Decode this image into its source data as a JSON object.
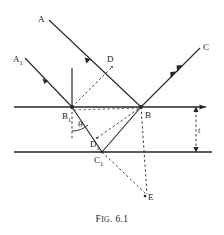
{
  "figure": {
    "caption_prefix": "F",
    "caption_smallcaps": "IG",
    "caption_rest": ". 6.1",
    "caption_full": "FIG. 6.1",
    "stroke_color": "#262626",
    "background_color": "#ffffff"
  },
  "labels": {
    "ray_a": "A",
    "ray_a1_base": "A",
    "ray_a1_sub": "1",
    "ray_c": "C",
    "point_d": "D",
    "point_d1_base": "D",
    "point_d1_sub": "1",
    "point_b_base": "B",
    "point_b1_base": "B",
    "point_b1_sub": "1",
    "point_c1_base": "C",
    "point_c1_sub": "1",
    "point_e": "E",
    "angle_theta": "θ",
    "thickness": "t"
  },
  "geometry": {
    "surface_top_y": 107,
    "surface_bottom_y": 152,
    "surface_left_x": 14,
    "surface_top_right_x": 206,
    "surface_bottom_right_x": 212,
    "point_b1": {
      "x": 72,
      "y": 107
    },
    "point_b": {
      "x": 141,
      "y": 107
    },
    "point_c1": {
      "x": 102,
      "y": 152
    },
    "point_d": {
      "x": 112,
      "y": 67
    },
    "point_d1": {
      "x": 97,
      "y": 138
    },
    "point_e": {
      "x": 147,
      "y": 196
    },
    "ray_a_start": {
      "x": 49,
      "y": 20
    },
    "ray_a1_start": {
      "x": 25,
      "y": 58
    },
    "ray_c_end": {
      "x": 200,
      "y": 48
    },
    "normal_top": {
      "x": 72,
      "y": 68
    },
    "dim_x": 196,
    "dim_label_pos": {
      "x": 199,
      "y": 132
    }
  }
}
